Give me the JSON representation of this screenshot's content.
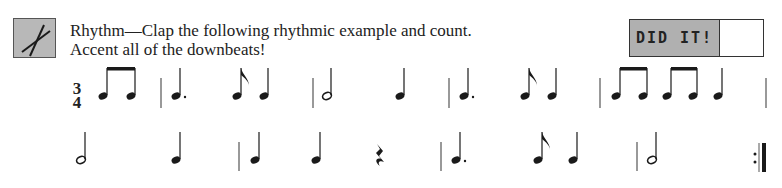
{
  "instructions": {
    "line1": "Rhythm—Clap the following rhythmic example and count.",
    "line2": "Accent all of the downbeats!"
  },
  "icon": "drumsticks-icon",
  "did_it": {
    "label": "DID IT!",
    "checked": false
  },
  "time_signature": {
    "top": "3",
    "bottom": "4"
  },
  "rows": [
    {
      "measures": [
        [
          "eighth-pair",
          "quarter"
        ],
        [
          "dotted-quarter",
          "eighth",
          "quarter"
        ],
        [
          "half",
          "quarter"
        ],
        [
          "dotted-quarter",
          "eighth",
          "quarter"
        ],
        [
          "eighth-pair",
          "eighth-pair",
          "quarter"
        ]
      ]
    },
    {
      "measures": [
        [
          "half",
          "quarter"
        ],
        [
          "quarter",
          "quarter",
          "quarter-rest"
        ],
        [
          "dotted-quarter",
          "eighth",
          "quarter"
        ],
        [
          "half"
        ]
      ],
      "ending": "repeat-end"
    }
  ]
}
